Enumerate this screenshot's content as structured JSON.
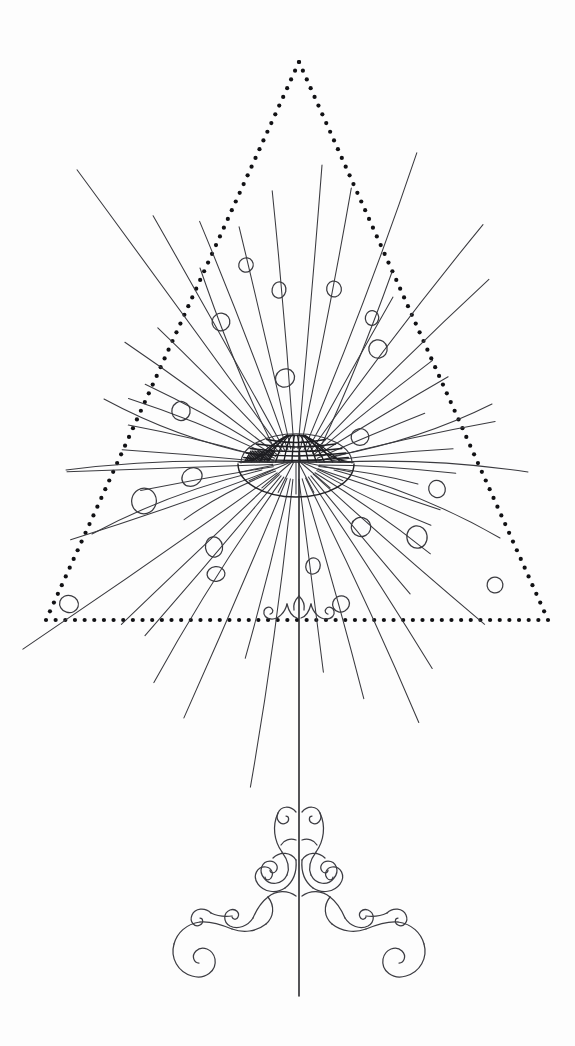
{
  "artwork": {
    "title": "Dandelion Lamp Line Drawing",
    "subject": "dandelion-lamp-illustration",
    "background_color": "#fdfdfd",
    "ink_color": "#3a3a3f",
    "dot_color": "#111114",
    "canvas": {
      "width": 575,
      "height": 1046
    }
  },
  "chart_data": {
    "type": "scatter",
    "xlabel": "",
    "ylabel": "",
    "xlim": [
      0,
      575
    ],
    "ylim": [
      0,
      1046
    ],
    "grid": false,
    "legend": "none",
    "annotations": [
      "dotted equilateral triangle frame",
      "radiating seed rays from hemispherical dome",
      "crosshatched mesh dome shade",
      "elliptical bowl rim",
      "slender vertical stem",
      "ornate double-volute scroll base"
    ],
    "series": [
      {
        "name": "triangle_vertices",
        "x": [
          299,
          46,
          548
        ],
        "y": [
          62,
          620,
          620
        ]
      },
      {
        "name": "seed_heads",
        "x": [
          246,
          279,
          334,
          221,
          372,
          378,
          285,
          181,
          360,
          192,
          144,
          214,
          437,
          361,
          417,
          495,
          69,
          216,
          341,
          313
        ],
        "y": [
          265,
          290,
          289,
          322,
          318,
          349,
          378,
          411,
          437,
          477,
          501,
          547,
          489,
          527,
          537,
          585,
          604,
          574,
          604,
          566
        ],
        "r": [
          8,
          7,
          7,
          8,
          7,
          9,
          9,
          10,
          9,
          10,
          11,
          9,
          8,
          9,
          11,
          8,
          9,
          8,
          9,
          7
        ]
      },
      {
        "name": "dome",
        "center_x": 296,
        "center_y": 464,
        "dome_rx": 55,
        "dome_ry": 28,
        "bowl_rx": 58,
        "bowl_ry": 32
      },
      {
        "name": "stem",
        "x": [
          299,
          299
        ],
        "y": [
          464,
          996
        ]
      }
    ]
  },
  "elements": {
    "triangle": {
      "label": "Dotted Triangle Frame",
      "dot_radius": 2.1,
      "dot_spacing": 9.6
    },
    "dome": {
      "label": "Mesh Dome Shade",
      "mesh_rows": 5,
      "mesh_cols": 13
    },
    "rays": {
      "label": "Radiating Seed Rays",
      "count": 44
    },
    "seeds": {
      "label": "Seed Head Circles",
      "count": 20
    },
    "stem": {
      "label": "Lamp Stem"
    },
    "base": {
      "label": "Ornate Scroll Base"
    },
    "finial": {
      "label": "Small Scroll Finial"
    }
  }
}
